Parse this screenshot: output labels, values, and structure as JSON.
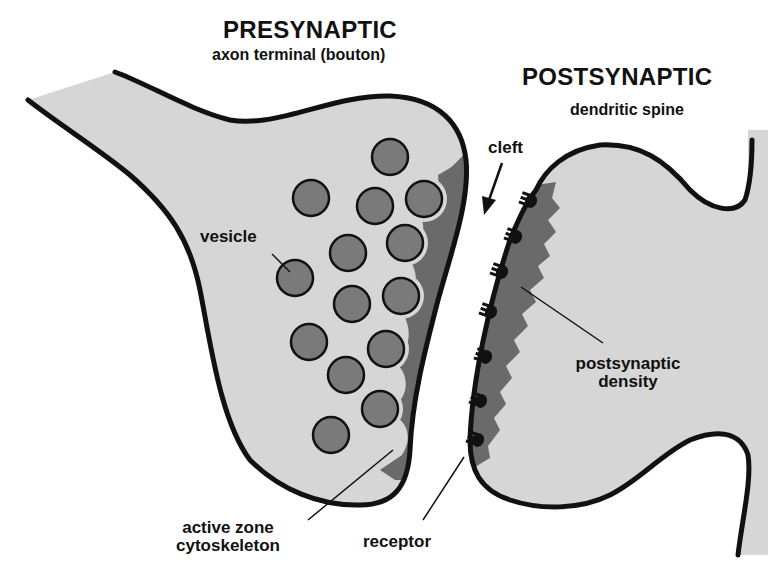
{
  "presynaptic": {
    "title": "PRESYNAPTIC",
    "subtitle": "axon terminal (bouton)"
  },
  "postsynaptic": {
    "title": "POSTSYNAPTIC",
    "subtitle": "dendritic spine"
  },
  "labels": {
    "vesicle": "vesicle",
    "cleft": "cleft",
    "postsynaptic_density_line1": "postsynaptic",
    "postsynaptic_density_line2": "density",
    "active_zone_line1": "active zone",
    "active_zone_line2": "cytoskeleton",
    "receptor": "receptor"
  },
  "colors": {
    "cytoplasm": "#d6d6d6",
    "vesicle_fill": "#7a7a7a",
    "density_fill": "#6a6a6a",
    "outline": "#111111",
    "background": "#ffffff"
  },
  "vesicles": [
    {
      "cx": 390,
      "cy": 157,
      "r": 18
    },
    {
      "cx": 311,
      "cy": 198,
      "r": 18
    },
    {
      "cx": 375,
      "cy": 206,
      "r": 18
    },
    {
      "cx": 424,
      "cy": 199,
      "r": 18
    },
    {
      "cx": 348,
      "cy": 253,
      "r": 18
    },
    {
      "cx": 405,
      "cy": 243,
      "r": 18
    },
    {
      "cx": 295,
      "cy": 278,
      "r": 18
    },
    {
      "cx": 352,
      "cy": 304,
      "r": 18
    },
    {
      "cx": 401,
      "cy": 296,
      "r": 18
    },
    {
      "cx": 309,
      "cy": 342,
      "r": 18
    },
    {
      "cx": 386,
      "cy": 349,
      "r": 18
    },
    {
      "cx": 346,
      "cy": 375,
      "r": 18
    },
    {
      "cx": 380,
      "cy": 409,
      "r": 18
    },
    {
      "cx": 331,
      "cy": 435,
      "r": 18
    }
  ],
  "receptors": [
    {
      "x": 531,
      "y": 201
    },
    {
      "x": 516,
      "y": 237
    },
    {
      "x": 502,
      "y": 272
    },
    {
      "x": 491,
      "y": 312
    },
    {
      "x": 486,
      "y": 357
    },
    {
      "x": 481,
      "y": 401
    },
    {
      "x": 478,
      "y": 440
    }
  ]
}
